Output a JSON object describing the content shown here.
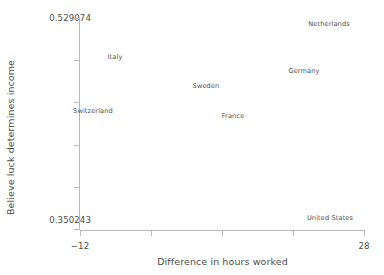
{
  "chart_data": {
    "type": "scatter",
    "title": "",
    "xlabel": "Difference in hours worked",
    "ylabel": "Believe luck determines income",
    "xlim": [
      -12,
      28
    ],
    "ylim": [
      0.350243,
      0.529074
    ],
    "x_tick_labels": [
      "−12",
      "",
      "",
      "",
      "28"
    ],
    "y_tick_labels": [
      "0.529074",
      "",
      "",
      "",
      "",
      "0.350243"
    ],
    "x_axis_min_label": "−12",
    "x_axis_max_label": "28",
    "y_axis_max_label": "0.529074",
    "y_axis_min_label": "0.350243",
    "grid": false,
    "legend": "none",
    "marker_style": "text-label-only",
    "points": [
      {
        "label": "Netherlands",
        "x": 24.6,
        "y": 0.5255,
        "px": 329,
        "py": 24
      },
      {
        "label": "Italy",
        "x": -6.9,
        "y": 0.4915,
        "px": 115,
        "py": 57
      },
      {
        "label": "Germany",
        "x": 20.0,
        "y": 0.469,
        "px": 304,
        "py": 71
      },
      {
        "label": "Sweden",
        "x": 5.6,
        "y": 0.456,
        "px": 206,
        "py": 86
      },
      {
        "label": "Switzerland",
        "x": -12.0,
        "y": 0.4335,
        "px": 93,
        "py": 111
      },
      {
        "label": "France",
        "x": 9.9,
        "y": 0.429,
        "px": 233,
        "py": 116
      },
      {
        "label": "United States",
        "x": 22.0,
        "y": 0.3545,
        "px": 330,
        "py": 218
      }
    ]
  },
  "axes": {
    "x_title": "Difference in hours worked",
    "y_title": "Believe luck determines income",
    "x_min_tick": "−12",
    "x_max_tick": "28",
    "y_max_tick": "0.529074",
    "y_min_tick": "0.350243"
  },
  "colors": {
    "axis": "#b8b8b8",
    "text": "#4d4d4d",
    "background": "#ffffff"
  }
}
